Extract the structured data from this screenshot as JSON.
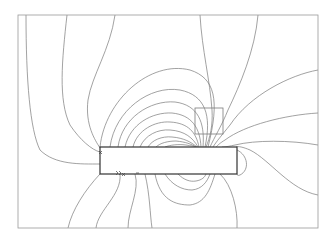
{
  "diagram": {
    "type": "field-line-plot",
    "colors": {
      "background": "#ffffff",
      "frame": "#9a9a9a",
      "lines": "#7a7a7a",
      "body": "#333333"
    },
    "elements": {
      "frame": {
        "x": 18,
        "y": 15,
        "w": 300,
        "h": 213
      },
      "body": {
        "x": 100,
        "y": 147,
        "w": 137,
        "h": 27
      },
      "square": {
        "x": 195,
        "y": 108,
        "w": 28,
        "h": 26
      }
    },
    "markers": [
      "x",
      "x",
      ">>",
      "+"
    ]
  }
}
